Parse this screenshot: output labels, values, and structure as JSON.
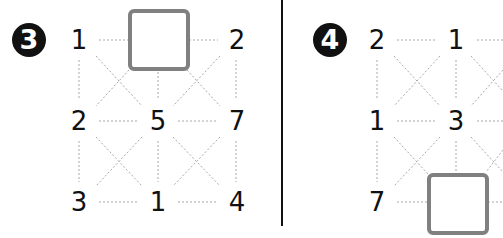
{
  "puzzles": [
    {
      "label": "3",
      "badge_text": "❸",
      "grid": [
        [
          "1",
          null,
          "2"
        ],
        [
          "2",
          "5",
          "7"
        ],
        [
          "3",
          "1",
          "4"
        ]
      ],
      "blank_cell": {
        "row": 0,
        "col": 1
      },
      "cells": {
        "r0c0": "1",
        "r0c2": "2",
        "r1c0": "2",
        "r1c1": "5",
        "r1c2": "7",
        "r2c0": "3",
        "r2c1": "1",
        "r2c2": "4"
      }
    },
    {
      "label": "4",
      "badge_text": "❹",
      "grid": [
        [
          "2",
          "1",
          ""
        ],
        [
          "1",
          "3",
          ""
        ],
        [
          "7",
          null,
          ""
        ]
      ],
      "blank_cell": {
        "row": 2,
        "col": 1
      },
      "cells": {
        "r0c0": "2",
        "r0c1": "1",
        "r1c0": "1",
        "r1c1": "3",
        "r2c0": "7"
      }
    }
  ],
  "colors": {
    "text": "#111111",
    "box_border": "#808080",
    "dotted_line": "#a0a0a0",
    "divider": "#111111"
  }
}
